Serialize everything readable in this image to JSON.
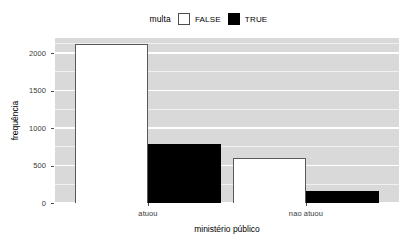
{
  "chart_data": {
    "type": "bar",
    "title": "",
    "subtitle": "",
    "xlabel": "ministério público",
    "ylabel": "frequência",
    "categories": [
      "atuou",
      "nao atuou"
    ],
    "series": [
      {
        "name": "FALSE",
        "values": [
          2120,
          605
        ],
        "color": "#ffffff"
      },
      {
        "name": "TRUE",
        "values": [
          790,
          160
        ],
        "color": "#000000"
      }
    ],
    "legend": {
      "title": "multa",
      "position": "top",
      "entries": [
        {
          "label": "FALSE",
          "swatch": "white-square"
        },
        {
          "label": "TRUE",
          "swatch": "black-square"
        }
      ]
    },
    "ylim": [
      0,
      2200
    ],
    "yticks": [
      0,
      500,
      1000,
      1500,
      2000
    ],
    "ytick_labels": [
      "0",
      "500",
      "1000",
      "1500",
      "2000"
    ],
    "xticks": [
      "atuou",
      "nao atuou"
    ],
    "grid": {
      "major_y": [
        0,
        500,
        1000,
        1500,
        2000
      ],
      "minor_y": [
        250,
        750,
        1250,
        1750,
        2125
      ],
      "major_x": false,
      "panel_background": "#d9d9d9",
      "gridline_color": "#ffffff"
    },
    "bar_positions": {
      "atuou": {
        "FALSE": [
          75,
          148
        ],
        "TRUE": [
          148,
          221
        ]
      },
      "nao atuou": {
        "FALSE": [
          233,
          306
        ],
        "TRUE": [
          306,
          379
        ]
      }
    }
  },
  "axis": {
    "ylabel": "frequência",
    "xlabel": "ministério público",
    "ytick_labels": [
      "2000",
      "1500",
      "1000",
      "500",
      "0"
    ],
    "xtick_labels": [
      "atuou",
      "nao atuou"
    ]
  },
  "legend": {
    "title": "multa",
    "false_label": "FALSE",
    "true_label": "TRUE"
  }
}
